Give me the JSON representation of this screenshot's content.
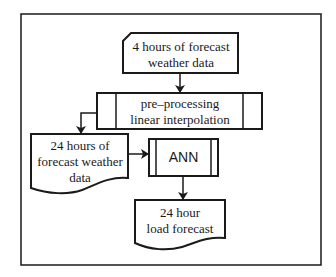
{
  "diagram": {
    "type": "flowchart",
    "nodes": {
      "input": {
        "shape": "card",
        "lines": [
          "4 hours of forecast",
          "weather data"
        ]
      },
      "preprocess": {
        "shape": "predefined-process",
        "lines": [
          "pre–processing",
          "linear interpolation"
        ]
      },
      "interpolated": {
        "shape": "document",
        "lines": [
          "24 hours of",
          "forecast weather",
          "data"
        ]
      },
      "ann": {
        "shape": "predefined-process",
        "lines": [
          "ANN"
        ]
      },
      "output": {
        "shape": "document",
        "lines": [
          "24 hour",
          "load forecast"
        ]
      }
    },
    "edges": [
      {
        "from": "input",
        "to": "preprocess"
      },
      {
        "from": "preprocess",
        "to": "interpolated"
      },
      {
        "from": "interpolated",
        "to": "ann"
      },
      {
        "from": "ann",
        "to": "output"
      }
    ],
    "colors": {
      "line": "#1a1a1a",
      "background": "#ffffff"
    }
  }
}
